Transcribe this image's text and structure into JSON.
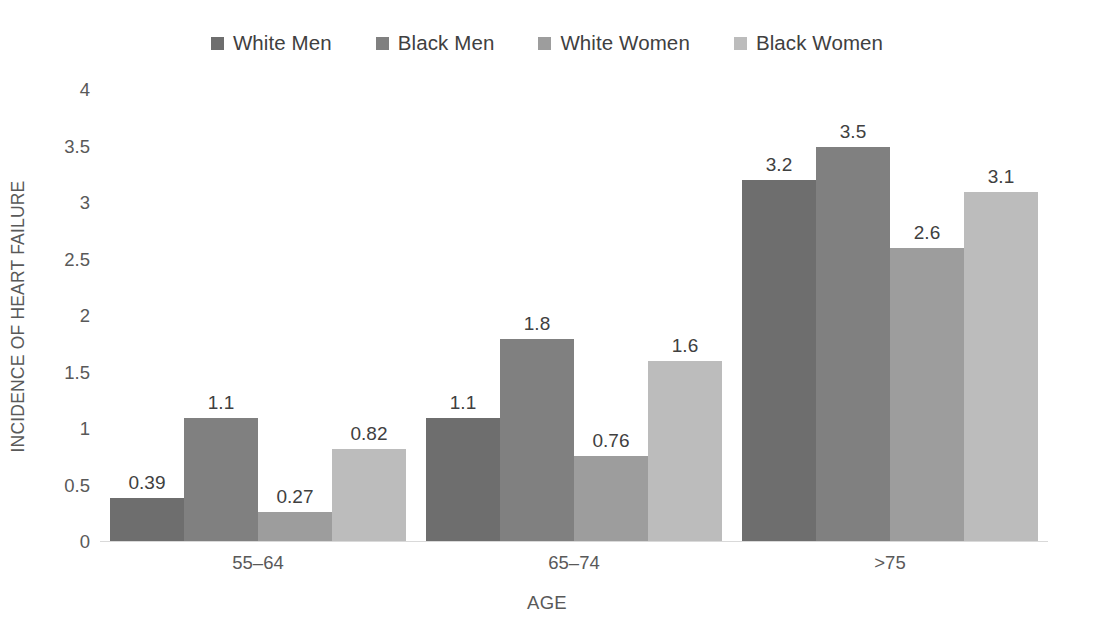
{
  "chart_data": {
    "type": "bar",
    "title": "",
    "xlabel": "AGE",
    "ylabel": "INCIDENCE OF HEART FAILURE",
    "categories": [
      "55–64",
      "65–74",
      ">75"
    ],
    "ylim": [
      0,
      4
    ],
    "yticks": [
      "0",
      "0.5",
      "1",
      "1.5",
      "2",
      "2.5",
      "3",
      "3.5",
      "4"
    ],
    "ytick_values": [
      0,
      0.5,
      1,
      1.5,
      2,
      2.5,
      3,
      3.5,
      4
    ],
    "grid": false,
    "legend_position": "top-center",
    "series": [
      {
        "name": "White Men",
        "color": "#6e6e6e",
        "values": [
          0.39,
          1.1,
          3.2
        ],
        "labels": [
          "0.39",
          "1.1",
          "3.2"
        ]
      },
      {
        "name": "Black Men",
        "color": "#808080",
        "values": [
          1.1,
          1.8,
          3.5
        ],
        "labels": [
          "1.1",
          "1.8",
          "3.5"
        ]
      },
      {
        "name": "White Women",
        "color": "#9d9d9d",
        "values": [
          0.27,
          0.76,
          2.6
        ],
        "labels": [
          "0.27",
          "0.76",
          "2.6"
        ]
      },
      {
        "name": "Black Women",
        "color": "#bcbcbc",
        "values": [
          0.82,
          1.6,
          3.1
        ],
        "labels": [
          "0.82",
          "1.6",
          "3.1"
        ]
      }
    ]
  },
  "legend": {
    "items": [
      {
        "label": "White Men",
        "color": "#6e6e6e"
      },
      {
        "label": "Black Men",
        "color": "#808080"
      },
      {
        "label": "White Women",
        "color": "#9d9d9d"
      },
      {
        "label": "Black Women",
        "color": "#bcbcbc"
      }
    ]
  },
  "axes": {
    "y_title": "INCIDENCE OF HEART FAILURE",
    "x_title": "AGE"
  }
}
